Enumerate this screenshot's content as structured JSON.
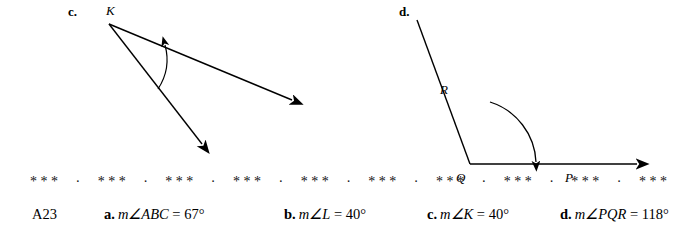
{
  "figures": [
    {
      "id": "c",
      "label": "c.",
      "vertex_label": "K",
      "angle_arc": "angle-arc-K"
    },
    {
      "id": "d",
      "label": "d.",
      "point_labels": {
        "r": "R",
        "q": "Q",
        "p": "P"
      },
      "angle_arc": "angle-arc-PQR"
    }
  ],
  "separator": {
    "pattern": "* * *     ·     * * *     ·     * * *     ·     * * *     ·     * * *     ·     * * *     ·     * * *     ·     * * *     ·     * * *     ·     * * *"
  },
  "answers": {
    "code": "A23",
    "items": [
      {
        "tag": "a.",
        "expr": "m∠ABC",
        "value": "= 67°"
      },
      {
        "tag": "b.",
        "expr": "m∠L",
        "value": "= 40°"
      },
      {
        "tag": "c.",
        "expr": "m∠K",
        "value": "= 40°"
      },
      {
        "tag": "d.",
        "expr": "m∠PQR",
        "value": "= 118°"
      }
    ]
  }
}
